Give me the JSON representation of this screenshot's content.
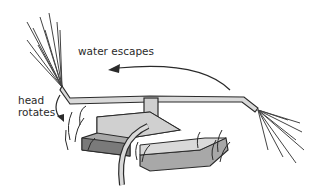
{
  "diagram": {
    "labels": {
      "water_escapes": "water escapes",
      "head_rotates_line1": "head",
      "head_rotates_line2": "rotates"
    },
    "colors": {
      "line": "#2a2a2a",
      "fill_light": "#d9d9d9",
      "fill_mid": "#a8a8a8",
      "fill_dark": "#7a7a7a",
      "background": "#ffffff"
    }
  }
}
